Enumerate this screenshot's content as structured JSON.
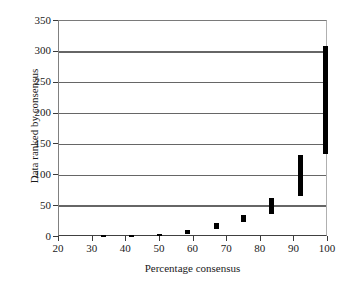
{
  "chart_data": {
    "type": "bar",
    "title": "",
    "subtitle": "",
    "xlabel": "Percentage consensus",
    "ylabel": "Data ranked by consensus",
    "xlim": [
      20,
      100
    ],
    "ylim": [
      0,
      350
    ],
    "xticks": [
      "20",
      "30",
      "40",
      "50",
      "60",
      "70",
      "80",
      "90",
      "100"
    ],
    "xtick_values": [
      20,
      30,
      40,
      50,
      60,
      70,
      80,
      90,
      100
    ],
    "yticks": [
      "0",
      "50",
      "100",
      "150",
      "200",
      "250",
      "300",
      "350"
    ],
    "ytick_values": [
      0,
      50,
      100,
      150,
      200,
      250,
      300,
      350
    ],
    "grid": "horizontal",
    "legend": "none",
    "bar_color": "#000000",
    "grid_color": "#666666",
    "series": [
      {
        "name": "Data rank range by consensus level",
        "orientation": "vertical-range",
        "bars": [
          {
            "x": 33.3,
            "low": 1,
            "high": 3
          },
          {
            "x": 41.7,
            "low": 1,
            "high": 4
          },
          {
            "x": 50.0,
            "low": 1,
            "high": 5
          },
          {
            "x": 58.3,
            "low": 5,
            "high": 11
          },
          {
            "x": 66.7,
            "low": 13,
            "high": 22
          },
          {
            "x": 75.0,
            "low": 25,
            "high": 36
          },
          {
            "x": 83.3,
            "low": 37,
            "high": 64
          },
          {
            "x": 91.7,
            "low": 66,
            "high": 133
          },
          {
            "x": 99.6,
            "low": 134,
            "high": 310
          }
        ]
      }
    ]
  }
}
